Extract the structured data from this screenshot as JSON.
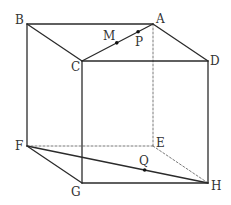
{
  "figure": {
    "type": "cube-oblique-projection",
    "vertices": [
      {
        "id": "A",
        "label": "A"
      },
      {
        "id": "B",
        "label": "B"
      },
      {
        "id": "C",
        "label": "C"
      },
      {
        "id": "D",
        "label": "D"
      },
      {
        "id": "E",
        "label": "E"
      },
      {
        "id": "F",
        "label": "F"
      },
      {
        "id": "G",
        "label": "G"
      },
      {
        "id": "H",
        "label": "H"
      }
    ],
    "edges": [
      {
        "from": "B",
        "to": "A",
        "style": "solid"
      },
      {
        "from": "B",
        "to": "C",
        "style": "solid"
      },
      {
        "from": "C",
        "to": "A",
        "style": "solid"
      },
      {
        "from": "A",
        "to": "D",
        "style": "solid"
      },
      {
        "from": "C",
        "to": "D",
        "style": "solid"
      },
      {
        "from": "B",
        "to": "F",
        "style": "solid"
      },
      {
        "from": "C",
        "to": "G",
        "style": "solid"
      },
      {
        "from": "D",
        "to": "H",
        "style": "solid"
      },
      {
        "from": "F",
        "to": "G",
        "style": "solid"
      },
      {
        "from": "G",
        "to": "H",
        "style": "solid"
      },
      {
        "from": "F",
        "to": "H",
        "style": "solid"
      },
      {
        "from": "A",
        "to": "E",
        "style": "dashed"
      },
      {
        "from": "F",
        "to": "E",
        "style": "dashed"
      },
      {
        "from": "E",
        "to": "H",
        "style": "dashed"
      }
    ],
    "points": [
      {
        "id": "M",
        "label": "M",
        "on_segment": [
          "C",
          "A"
        ]
      },
      {
        "id": "P",
        "label": "P",
        "on_segment": [
          "C",
          "A"
        ]
      },
      {
        "id": "Q",
        "label": "Q",
        "on_segment": [
          "F",
          "H"
        ]
      }
    ],
    "colors": {
      "line": "#2b2b2b",
      "hidden_line": "#6a6a6a",
      "label": "#333333",
      "point": "#111111"
    }
  }
}
